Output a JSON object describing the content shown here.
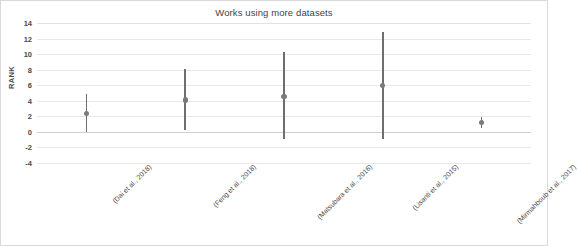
{
  "chart_data": {
    "type": "scatter",
    "title": "Works using more datasets",
    "xlabel": "",
    "ylabel": "RANK",
    "ylim": [
      -4,
      14
    ],
    "ytick_step": 2,
    "yticks": [
      14,
      12,
      10,
      8,
      6,
      4,
      2,
      0,
      -2,
      -4
    ],
    "grid": true,
    "legend": "none",
    "categories": [
      "(Dai et al., 2018)",
      "(Feng et al., 2018)",
      "(Matsubara et al., 2016)",
      "(Lisanti et al., 2015)",
      "(Mirmahboub et al., 2017)"
    ],
    "values": [
      2.4,
      4.1,
      4.6,
      6.0,
      1.2
    ],
    "error_low": [
      0.0,
      0.2,
      -0.9,
      -0.9,
      0.5
    ],
    "error_high": [
      4.9,
      8.1,
      10.3,
      12.9,
      1.9
    ],
    "series": [
      {
        "name": "RANK",
        "points": [
          {
            "category": "(Dai et al., 2018)",
            "value": 2.4,
            "low": 0.0,
            "high": 4.9
          },
          {
            "category": "(Feng et al., 2018)",
            "value": 4.1,
            "low": 0.2,
            "high": 8.1
          },
          {
            "category": "(Matsubara et al., 2016)",
            "value": 4.6,
            "low": -0.9,
            "high": 10.3
          },
          {
            "category": "(Lisanti et al., 2015)",
            "value": 6.0,
            "low": -0.9,
            "high": 12.9
          },
          {
            "category": "(Mirmahboub et al., 2017)",
            "value": 1.2,
            "low": 0.5,
            "high": 1.9
          }
        ]
      }
    ]
  },
  "colors": {
    "marker": "#7a7a7a",
    "errorbar": "#6e6e6e",
    "gridline": "#e8e8e8",
    "text": "#4a4a4a",
    "title": "#3f3f3f",
    "border": "#d9d9d9",
    "background": "#ffffff"
  }
}
